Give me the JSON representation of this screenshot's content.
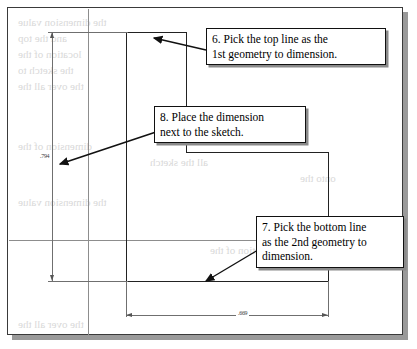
{
  "figure": {
    "type": "cad-sketch-instruction-figure",
    "callouts": [
      {
        "id": "callout-6",
        "lines": [
          "6. Pick the top line as the",
          "1st geometry to dimension."
        ],
        "points_to": "top-geometry-line"
      },
      {
        "id": "callout-8",
        "lines": [
          "8. Place the dimension",
          "next to the sketch."
        ],
        "points_to": "vertical-dimension-text"
      },
      {
        "id": "callout-7",
        "lines": [
          "7. Pick the bottom line",
          "as the 2nd geometry to",
          "dimension."
        ],
        "points_to": "bottom-geometry-line"
      }
    ],
    "dimensions": [
      {
        "id": "vertical-dimension",
        "value": ".794",
        "orientation": "vertical"
      },
      {
        "id": "horizontal-dimension",
        "value": ".669",
        "orientation": "horizontal"
      }
    ],
    "ghost_text": [
      "the dimension value",
      "and the top",
      "location of the",
      "the sketch to",
      "the over all the",
      "dimension of the",
      "all the sketch",
      "onto the"
    ],
    "colors": {
      "geometry": "#4a4a4a",
      "geometry_dark": "#222222",
      "dimension": "#6f6f6f",
      "callout_border": "#111111",
      "callout_shadow": "#8a8a8a",
      "sheet_border": "#3a3a3a",
      "sheet_shadow": "#9a9a9a",
      "ghost": "#d9d9d9"
    }
  }
}
